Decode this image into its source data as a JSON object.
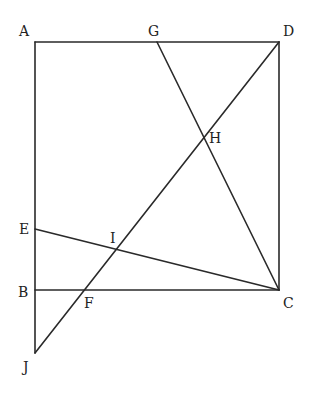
{
  "diagram": {
    "type": "geometry-figure",
    "points": [
      {
        "id": "A",
        "label": "A"
      },
      {
        "id": "B",
        "label": "B"
      },
      {
        "id": "C",
        "label": "C"
      },
      {
        "id": "D",
        "label": "D"
      },
      {
        "id": "E",
        "label": "E"
      },
      {
        "id": "F",
        "label": "F"
      },
      {
        "id": "G",
        "label": "G"
      },
      {
        "id": "H",
        "label": "H"
      },
      {
        "id": "I",
        "label": "I"
      },
      {
        "id": "J",
        "label": "J"
      }
    ],
    "segments": [
      {
        "from": "A",
        "to": "D"
      },
      {
        "from": "D",
        "to": "C"
      },
      {
        "from": "B",
        "to": "C"
      },
      {
        "from": "A",
        "to": "J"
      },
      {
        "from": "D",
        "to": "J"
      },
      {
        "from": "G",
        "to": "C"
      },
      {
        "from": "E",
        "to": "C"
      }
    ],
    "line_color": "#2a2a2a"
  }
}
